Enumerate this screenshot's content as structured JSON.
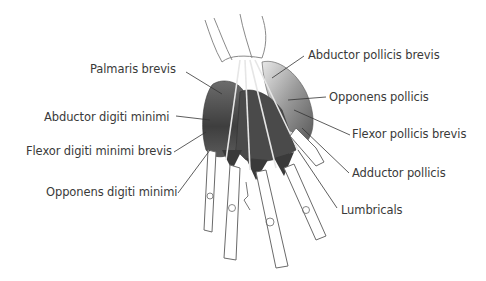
{
  "diagram": {
    "background": "#ffffff",
    "text_color": "#3a3a3a",
    "muscle_color": "#4a4a4a",
    "bone_outline_color": "#6a6a6a",
    "labels_left": [
      {
        "text": "Palmaris brevis",
        "x": 90,
        "y": 62
      },
      {
        "text": "Abductor digiti minimi",
        "x": 44,
        "y": 110
      },
      {
        "text": "Flexor digiti minimi brevis",
        "x": 26,
        "y": 144
      },
      {
        "text": "Opponens digiti minimi",
        "x": 46,
        "y": 185
      }
    ],
    "labels_right": [
      {
        "text": "Abductor pollicis brevis",
        "x": 308,
        "y": 48
      },
      {
        "text": "Opponens pollicis",
        "x": 329,
        "y": 90
      },
      {
        "text": "Flexor pollicis brevis",
        "x": 352,
        "y": 127
      },
      {
        "text": "Adductor pollicis",
        "x": 352,
        "y": 166
      },
      {
        "text": "Lumbricals",
        "x": 341,
        "y": 203
      }
    ],
    "signature": "artist signature"
  }
}
